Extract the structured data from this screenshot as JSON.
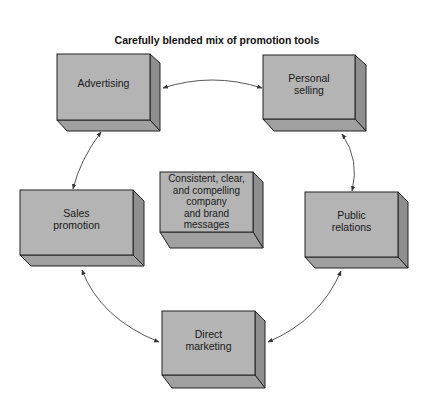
{
  "title": "Carefully blended mix of promotion tools",
  "colors": {
    "front": "#b4b4b4",
    "side": "#8f8f8f",
    "bottom": "#a0a0a0",
    "edge": "#222222",
    "arrow": "#444444"
  },
  "boxes": {
    "advertising": {
      "label": "Advertising"
    },
    "personal_selling": {
      "label": "Personal\nselling",
      "line1": "Personal",
      "line2": "selling"
    },
    "center": {
      "line1": "Consistent, clear,",
      "line2": "and compelling",
      "line3": "company",
      "line4": "and brand",
      "line5": "messages"
    },
    "sales_promotion": {
      "line1": "Sales",
      "line2": "promotion"
    },
    "public_relations": {
      "line1": "Public",
      "line2": "relations"
    },
    "direct_marketing": {
      "line1": "Direct",
      "line2": "marketing"
    }
  },
  "connections": [
    {
      "from": "Advertising",
      "to": "Personal selling",
      "type": "bidirectional"
    },
    {
      "from": "Personal selling",
      "to": "Public relations",
      "type": "bidirectional"
    },
    {
      "from": "Public relations",
      "to": "Direct marketing",
      "type": "bidirectional"
    },
    {
      "from": "Direct marketing",
      "to": "Sales promotion",
      "type": "bidirectional"
    },
    {
      "from": "Sales promotion",
      "to": "Advertising",
      "type": "bidirectional"
    }
  ]
}
